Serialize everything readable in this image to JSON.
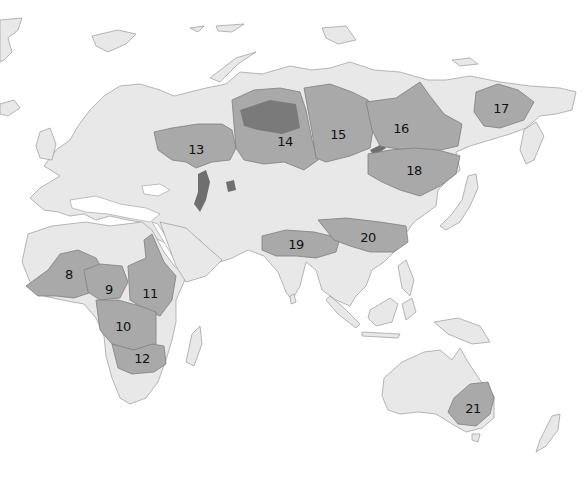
{
  "map": {
    "title": "",
    "colors": {
      "background": "#ffffff",
      "land": "#e8e8e8",
      "basin": "#a9a9a9",
      "dense": "#7a7a7a",
      "border": "#9a9a9a"
    },
    "regions": [
      {
        "id": "8",
        "label": "8",
        "x": 69,
        "y": 274
      },
      {
        "id": "9",
        "label": "9",
        "x": 109,
        "y": 289
      },
      {
        "id": "10",
        "label": "10",
        "x": 123,
        "y": 326
      },
      {
        "id": "11",
        "label": "11",
        "x": 150,
        "y": 293
      },
      {
        "id": "12",
        "label": "12",
        "x": 142,
        "y": 358
      },
      {
        "id": "13",
        "label": "13",
        "x": 196,
        "y": 149
      },
      {
        "id": "14",
        "label": "14",
        "x": 285,
        "y": 141
      },
      {
        "id": "15",
        "label": "15",
        "x": 338,
        "y": 134
      },
      {
        "id": "16",
        "label": "16",
        "x": 401,
        "y": 128
      },
      {
        "id": "17",
        "label": "17",
        "x": 501,
        "y": 108
      },
      {
        "id": "18",
        "label": "18",
        "x": 414,
        "y": 170
      },
      {
        "id": "19",
        "label": "19",
        "x": 296,
        "y": 244
      },
      {
        "id": "20",
        "label": "20",
        "x": 368,
        "y": 237
      },
      {
        "id": "21",
        "label": "21",
        "x": 473,
        "y": 408
      }
    ]
  }
}
